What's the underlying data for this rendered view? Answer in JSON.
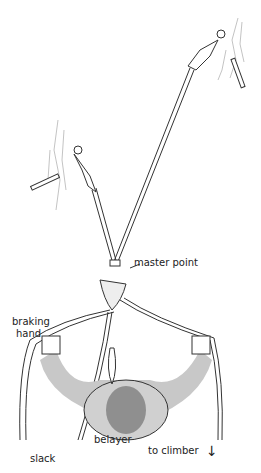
{
  "diagram": {
    "type": "belay anchor diagram",
    "labels": {
      "master_point": "master point",
      "braking_hand_line1": "braking",
      "braking_hand_line2": "hand",
      "belayer": "belayer",
      "slack": "slack",
      "to_climber": "to climber"
    },
    "icons": {
      "down_arrow": "↓"
    },
    "colors": {
      "line": "#333333",
      "body": "#c8c8c8",
      "head": "#8f8f8f",
      "rock": "#999999"
    }
  }
}
